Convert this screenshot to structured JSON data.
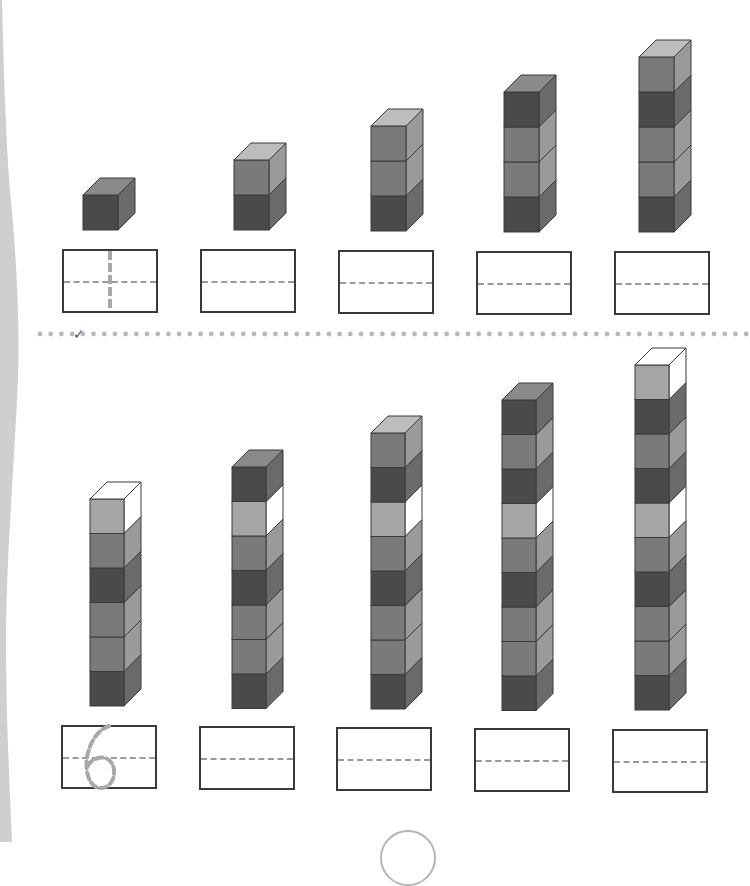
{
  "worksheet": {
    "colors": {
      "front": {
        "dark": "#4a4a4a",
        "mid": "#7a7a7a",
        "light": "#a6a6a6"
      },
      "side": {
        "dark": "#6a6a6a",
        "mid": "#9a9a9a",
        "light": "#c8c8c8",
        "white": "#ffffff"
      },
      "top": {
        "dark": "#8a8a8a",
        "mid": "#bdbdbd",
        "light": "#dcdcdc",
        "white": "#ffffff"
      },
      "outline": "#3a3a3a",
      "margin": "#cfcfcf",
      "dots": "#b8b8b8",
      "hint": "#a8a8a8"
    },
    "top_row": {
      "stacks": [
        {
          "count": 1,
          "cubes": [
            "dark"
          ]
        },
        {
          "count": 2,
          "cubes": [
            "mid",
            "dark"
          ]
        },
        {
          "count": 3,
          "cubes": [
            "mid",
            "mid",
            "dark"
          ]
        },
        {
          "count": 4,
          "cubes": [
            "dark",
            "mid",
            "mid",
            "dark"
          ]
        },
        {
          "count": 5,
          "cubes": [
            "mid",
            "dark",
            "mid",
            "mid",
            "dark"
          ]
        }
      ],
      "answer_boxes": [
        {
          "hint": "1",
          "value": ""
        },
        {
          "hint": "",
          "value": ""
        },
        {
          "hint": "",
          "value": ""
        },
        {
          "hint": "",
          "value": ""
        },
        {
          "hint": "",
          "value": ""
        }
      ]
    },
    "separator": {
      "check_mark": "✓"
    },
    "bottom_row": {
      "stacks": [
        {
          "count": 6,
          "cubes": [
            "light",
            "mid",
            "dark",
            "mid",
            "mid",
            "dark"
          ]
        },
        {
          "count": 7,
          "cubes": [
            "dark",
            "light",
            "mid",
            "dark",
            "mid",
            "mid",
            "dark"
          ]
        },
        {
          "count": 8,
          "cubes": [
            "mid",
            "dark",
            "light",
            "mid",
            "dark",
            "mid",
            "mid",
            "dark"
          ]
        },
        {
          "count": 9,
          "cubes": [
            "dark",
            "mid",
            "dark",
            "light",
            "mid",
            "dark",
            "mid",
            "mid",
            "dark"
          ]
        },
        {
          "count": 10,
          "cubes": [
            "light",
            "dark",
            "mid",
            "dark",
            "light",
            "mid",
            "dark",
            "mid",
            "mid",
            "dark"
          ]
        }
      ],
      "answer_boxes": [
        {
          "hint": "6",
          "value": ""
        },
        {
          "hint": "",
          "value": ""
        },
        {
          "hint": "",
          "value": ""
        },
        {
          "hint": "",
          "value": ""
        },
        {
          "hint": "",
          "value": ""
        }
      ]
    }
  }
}
